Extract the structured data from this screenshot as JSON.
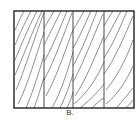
{
  "figure": {
    "caption": "B.",
    "frame": {
      "x": 14,
      "y": 11,
      "width": 120,
      "height": 97
    },
    "dividers_x": [
      44,
      73,
      104
    ],
    "stroke_color": "#333333",
    "frame_color": "#222222"
  }
}
